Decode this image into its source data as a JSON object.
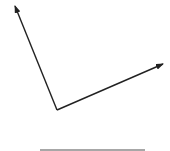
{
  "diagram": {
    "background": "#ffffff",
    "vector_color": "#222222",
    "baseline_color": "#8a8a8a",
    "origin": {
      "x": 57,
      "y": 110
    },
    "vectors": [
      {
        "name": "vector-up-left",
        "tip": {
          "x": 15,
          "y": 6
        }
      },
      {
        "name": "vector-right",
        "tip": {
          "x": 163,
          "y": 64
        }
      }
    ],
    "baseline": {
      "x1": 40,
      "x2": 145,
      "y": 150
    }
  }
}
